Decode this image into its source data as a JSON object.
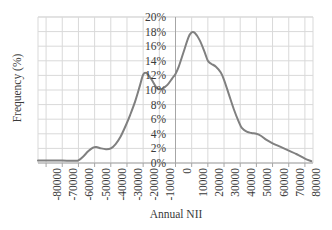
{
  "chart_data": {
    "type": "line",
    "title": "",
    "xlabel": "Annual NII",
    "ylabel": "Frequency (%)",
    "xlim": [
      -85000,
      85000
    ],
    "ylim": [
      0,
      20
    ],
    "grid": true,
    "legend": false,
    "legend_position": "none",
    "line_color": "#808080",
    "grid_color": "#d9d9d9",
    "axis_color": "#a6a6a6",
    "text_color": "#3a3a3a",
    "x_tick_labels": [
      "-80000",
      "-70000",
      "-60000",
      "-50000",
      "-40000",
      "-30000",
      "-20000",
      "-10000",
      "0",
      "10000",
      "20000",
      "30000",
      "40000",
      "50000",
      "60000",
      "70000",
      "80000"
    ],
    "x_ticks": [
      -80000,
      -70000,
      -60000,
      -50000,
      -40000,
      -30000,
      -20000,
      -10000,
      0,
      10000,
      20000,
      30000,
      40000,
      50000,
      60000,
      70000,
      80000
    ],
    "y_tick_labels": [
      "0%",
      "2%",
      "4%",
      "6%",
      "8%",
      "10%",
      "12%",
      "14%",
      "16%",
      "18%",
      "20%"
    ],
    "y_ticks": [
      0,
      2,
      4,
      6,
      8,
      10,
      12,
      14,
      16,
      18,
      20
    ],
    "series": [
      {
        "name": "Annual NII frequency",
        "x": [
          -85000,
          -80000,
          -75000,
          -70000,
          -65000,
          -62000,
          -60000,
          -57000,
          -54000,
          -51000,
          -49000,
          -46000,
          -43000,
          -40000,
          -37000,
          -34000,
          -31000,
          -28000,
          -25000,
          -22000,
          -20000,
          -18000,
          -15000,
          -12000,
          -10000,
          -8000,
          -5000,
          -2000,
          0,
          2000,
          5000,
          8000,
          10000,
          12000,
          15000,
          18000,
          20000,
          22000,
          25000,
          28000,
          30000,
          33000,
          36000,
          39000,
          41000,
          44000,
          47000,
          50000,
          53000,
          56000,
          60000,
          65000,
          70000,
          75000,
          80000,
          84000
        ],
        "y": [
          0.35,
          0.35,
          0.35,
          0.35,
          0.3,
          0.3,
          0.35,
          0.9,
          1.6,
          2.1,
          2.2,
          2.0,
          1.9,
          2.0,
          2.6,
          3.6,
          5.0,
          6.6,
          8.4,
          10.6,
          12.1,
          12.3,
          11.5,
          10.4,
          10.1,
          10.2,
          10.7,
          11.6,
          12.2,
          13.2,
          15.2,
          17.2,
          17.9,
          17.8,
          16.8,
          15.2,
          14.0,
          13.6,
          13.2,
          12.4,
          11.4,
          9.4,
          7.4,
          5.7,
          4.8,
          4.3,
          4.1,
          4.0,
          3.7,
          3.2,
          2.7,
          2.2,
          1.7,
          1.2,
          0.6,
          0.25
        ]
      }
    ]
  },
  "axes": {
    "y_title": "Frequency (%)",
    "x_title": "Annual NII"
  }
}
